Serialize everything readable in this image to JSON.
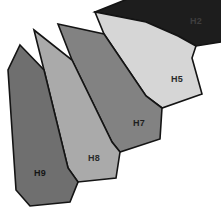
{
  "figure": {
    "type": "polygon-fan-diagram",
    "width": 221,
    "height": 223,
    "background_color": "#ffffff",
    "outline_color": "#141414",
    "shapes": [
      {
        "id": "H2",
        "label": "H2",
        "fill": "#1d1d1d",
        "label_color": "#3f3f3f",
        "label_x": 196,
        "label_y": 22,
        "points": "95,12 160,-14 224,-8 232,8 221,42 196,46 178,36 146,22"
      },
      {
        "id": "H5",
        "label": "H5",
        "fill": "#d6d6d6",
        "label_color": "#2a2a2a",
        "label_x": 177,
        "label_y": 80,
        "points": "95,12 146,22 178,36 196,46 192,58 202,94 162,108 146,96 104,34"
      },
      {
        "id": "H7",
        "label": "H7",
        "fill": "#828282",
        "label_color": "#1e1e1e",
        "label_x": 139,
        "label_y": 124,
        "points": "58,24 104,34 146,96 162,108 160,139 120,152 112,142 72,60"
      },
      {
        "id": "H8",
        "label": "H8",
        "fill": "#aaaaaa",
        "label_color": "#2a2a2a",
        "label_x": 94,
        "label_y": 159,
        "points": "34,30 72,60 112,142 120,152 116,178 78,182 68,168 44,70"
      },
      {
        "id": "H9",
        "label": "H9",
        "fill": "#6f6f6f",
        "label_color": "#151515",
        "label_x": 40,
        "label_y": 174,
        "points": "20,45 44,70 68,168 78,182 70,202 30,206 16,190 8,70"
      }
    ]
  }
}
